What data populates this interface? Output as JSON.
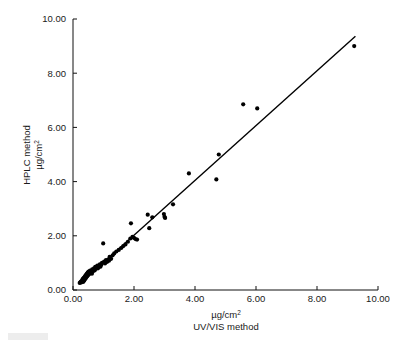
{
  "figure": {
    "kind": "scatter-plot-with-regression-line",
    "background_color": "#ffffff",
    "point_color": "#000000",
    "line_color": "#000000",
    "axis_color": "#111111"
  },
  "chart_data": {
    "type": "scatter",
    "title": "",
    "subtitle": "",
    "xlabel_line1": "µg/cm",
    "xlabel_line1_sup": "2",
    "xlabel_line2": "UV/VIS method",
    "ylabel_line1": "HPLC method",
    "ylabel_line2": "µg/cm",
    "ylabel_line2_sup": "2",
    "xlim": [
      0.0,
      10.0
    ],
    "ylim": [
      0.0,
      10.0
    ],
    "xticks": [
      0.0,
      2.0,
      4.0,
      6.0,
      8.0,
      10.0
    ],
    "yticks": [
      0.0,
      2.0,
      4.0,
      6.0,
      8.0,
      10.0
    ],
    "xtick_labels": [
      "0.00",
      "2.00",
      "4.00",
      "6.00",
      "8.00",
      "10.00"
    ],
    "ytick_labels": [
      "0.00",
      "2.00",
      "4.00",
      "6.00",
      "8.00",
      "10.00"
    ],
    "grid": false,
    "legend": null,
    "legend_position": "none",
    "marker": "filled-circle",
    "marker_size_px": 3.0,
    "regression_line": {
      "label": "fit line",
      "x_start": 0.22,
      "y_start": 0.22,
      "x_end": 9.26,
      "y_end": 9.36,
      "slope": 1.012,
      "intercept": -0.003
    },
    "points": [
      [
        0.22,
        0.26
      ],
      [
        0.25,
        0.3
      ],
      [
        0.27,
        0.28
      ],
      [
        0.28,
        0.33
      ],
      [
        0.3,
        0.31
      ],
      [
        0.31,
        0.38
      ],
      [
        0.32,
        0.34
      ],
      [
        0.33,
        0.42
      ],
      [
        0.34,
        0.3
      ],
      [
        0.35,
        0.4
      ],
      [
        0.36,
        0.46
      ],
      [
        0.37,
        0.35
      ],
      [
        0.38,
        0.44
      ],
      [
        0.39,
        0.5
      ],
      [
        0.4,
        0.41
      ],
      [
        0.41,
        0.48
      ],
      [
        0.42,
        0.55
      ],
      [
        0.43,
        0.45
      ],
      [
        0.44,
        0.52
      ],
      [
        0.45,
        0.6
      ],
      [
        0.46,
        0.5
      ],
      [
        0.47,
        0.57
      ],
      [
        0.48,
        0.64
      ],
      [
        0.49,
        0.54
      ],
      [
        0.5,
        0.61
      ],
      [
        0.51,
        0.68
      ],
      [
        0.52,
        0.58
      ],
      [
        0.53,
        0.66
      ],
      [
        0.55,
        0.62
      ],
      [
        0.56,
        0.72
      ],
      [
        0.58,
        0.65
      ],
      [
        0.6,
        0.7
      ],
      [
        0.62,
        0.6
      ],
      [
        0.63,
        0.76
      ],
      [
        0.65,
        0.68
      ],
      [
        0.67,
        0.74
      ],
      [
        0.69,
        0.8
      ],
      [
        0.71,
        0.72
      ],
      [
        0.73,
        0.85
      ],
      [
        0.75,
        0.78
      ],
      [
        0.78,
        0.84
      ],
      [
        0.8,
        0.9
      ],
      [
        0.82,
        0.8
      ],
      [
        0.85,
        0.88
      ],
      [
        0.88,
        0.95
      ],
      [
        0.9,
        0.86
      ],
      [
        0.93,
        0.93
      ],
      [
        0.95,
        1.0
      ],
      [
        0.99,
        1.72
      ],
      [
        1.02,
        1.05
      ],
      [
        1.05,
        0.98
      ],
      [
        1.08,
        1.1
      ],
      [
        1.12,
        1.04
      ],
      [
        1.15,
        1.12
      ],
      [
        1.18,
        1.08
      ],
      [
        1.2,
        1.22
      ],
      [
        1.25,
        1.15
      ],
      [
        1.3,
        1.28
      ],
      [
        1.35,
        1.35
      ],
      [
        1.42,
        1.42
      ],
      [
        1.5,
        1.48
      ],
      [
        1.58,
        1.55
      ],
      [
        1.65,
        1.62
      ],
      [
        1.72,
        1.68
      ],
      [
        1.8,
        1.78
      ],
      [
        1.88,
        1.9
      ],
      [
        1.9,
        2.46
      ],
      [
        1.95,
        1.96
      ],
      [
        2.0,
        1.92
      ],
      [
        2.05,
        1.88
      ],
      [
        2.1,
        1.86
      ],
      [
        2.45,
        2.78
      ],
      [
        2.5,
        2.28
      ],
      [
        2.6,
        2.68
      ],
      [
        2.98,
        2.8
      ],
      [
        3.0,
        2.7
      ],
      [
        3.02,
        2.66
      ],
      [
        3.28,
        3.16
      ],
      [
        3.8,
        4.3
      ],
      [
        4.7,
        4.08
      ],
      [
        4.78,
        5.0
      ],
      [
        5.58,
        6.85
      ],
      [
        6.04,
        6.7
      ],
      [
        9.22,
        9.0
      ]
    ]
  }
}
